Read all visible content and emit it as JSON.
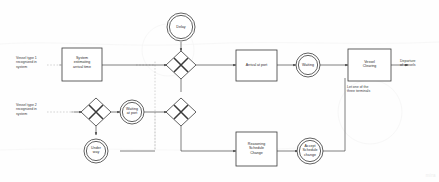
{
  "diagram": {
    "type": "bpmn-process-flow",
    "colors": {
      "stroke": "#3a3a3a",
      "fill": "#ffffff",
      "text": "#2b2b2b",
      "dashed_flow": "#b9b9b9",
      "background": "#fefefe"
    },
    "start_labels": {
      "vessel_type_1": "Vessel type 1\nrecognized in\nsystem",
      "vessel_type_2": "Vessel type 2\nrecognized in\nsystem"
    },
    "end_labels": {
      "departure": "Departure\nof vessels"
    },
    "annotations": {
      "terminal_note": "Let one of the\nthree terminals"
    },
    "nodes": [
      {
        "id": "sys-estimating",
        "shape": "task",
        "label": "System\nestimating\narrival time"
      },
      {
        "id": "delay",
        "shape": "event-double",
        "label": "Delay"
      },
      {
        "id": "gateway-top",
        "shape": "gateway-complex",
        "label": ""
      },
      {
        "id": "arrival-at-port",
        "shape": "task",
        "label": "Arrival at port"
      },
      {
        "id": "waiting",
        "shape": "event-double",
        "label": "Waiting"
      },
      {
        "id": "vessel-clearing",
        "shape": "task",
        "label": "Vessel\nClearing"
      },
      {
        "id": "gateway-left",
        "shape": "gateway-complex",
        "label": ""
      },
      {
        "id": "waiting-at-port",
        "shape": "event-double",
        "label": "Waiting\nat port"
      },
      {
        "id": "under-way",
        "shape": "event-double",
        "label": "Under\nway"
      },
      {
        "id": "gateway-bottom",
        "shape": "gateway-complex",
        "label": ""
      },
      {
        "id": "reasoning-schedule-change",
        "shape": "task",
        "label": "Reasoning\nSchedule\nChange"
      },
      {
        "id": "accept-schedule-change",
        "shape": "event-double",
        "label": "Accept\nSchedule\nchange"
      }
    ],
    "watermark": "mira"
  }
}
